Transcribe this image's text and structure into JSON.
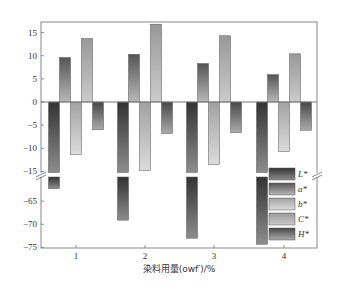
{
  "chart_data": {
    "type": "bar",
    "title": "",
    "xlabel": "染料用量(owf)/%",
    "ylabel": "",
    "categories": [
      "1",
      "2",
      "3",
      "4"
    ],
    "series": [
      {
        "name": "L*",
        "values": [
          -62.3,
          -69.1,
          -73.0,
          -74.3
        ],
        "color_top": "#3a3a3a",
        "color_bottom": "#8a8a8a"
      },
      {
        "name": "a*",
        "values": [
          9.6,
          10.3,
          8.3,
          5.9
        ],
        "color_top": "#555555",
        "color_bottom": "#b5b5b5"
      },
      {
        "name": "b*",
        "values": [
          -11.3,
          -14.8,
          -13.5,
          -10.7
        ],
        "color_top": "#a0a0a0",
        "color_bottom": "#d8d8d8"
      },
      {
        "name": "C*",
        "values": [
          13.7,
          16.8,
          14.3,
          10.4
        ],
        "color_top": "#9a9a9a",
        "color_bottom": "#c8c8c8"
      },
      {
        "name": "H*",
        "values": [
          -6.0,
          -6.8,
          -6.6,
          -6.1
        ],
        "color_top": "#4a4a4a",
        "color_bottom": "#a8a8a8"
      }
    ],
    "y_axis": {
      "broken": true,
      "upper_segment": {
        "range": [
          -15,
          17
        ],
        "ticks": [
          15,
          10,
          5,
          0,
          -5,
          -10,
          -15
        ]
      },
      "lower_segment": {
        "range": [
          -75,
          -60
        ],
        "ticks": [
          -65,
          -70,
          -75
        ]
      }
    },
    "grid": false,
    "legend_position": "lower-right inside plot",
    "zero_line": true
  },
  "labels": {
    "y_ticks_upper": [
      "15",
      "10",
      "5",
      "0",
      "−5",
      "−10",
      "−15"
    ],
    "y_ticks_lower": [
      "−65",
      "−70",
      "−75"
    ],
    "x_ticks": [
      "1",
      "2",
      "3",
      "4"
    ],
    "x_title": "染料用量(owf′)/%",
    "legend": [
      "L*",
      "a*",
      "b*",
      "C*",
      "H*"
    ]
  }
}
